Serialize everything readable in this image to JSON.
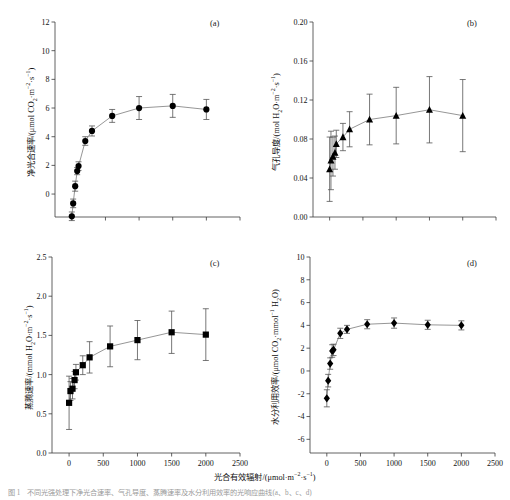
{
  "figure": {
    "xlabel": "光合有效辐射/(μmol·m⁻²·s⁻¹)",
    "caption": "图 1　不同光强处理下净光合速率、气孔导度、蒸腾速率及水分利用效率的光响应曲线(a、b、c、d)",
    "xticks": [
      "0",
      "500",
      "1000",
      "1500",
      "2000",
      "2500"
    ],
    "xlim": [
      -250,
      2500
    ]
  },
  "chart_data": [
    {
      "type": "line",
      "panel": "a",
      "tag": "(a)",
      "title": "",
      "marker": "circle",
      "xlabel": "光合有效辐射/(μmol·m⁻²·s⁻¹)",
      "ylabel": "净光合速率/(μmol CO₂·m⁻²·s⁻¹)",
      "ylabel_parts": {
        "name": "净光合速率",
        "unit_pre": "/(μmol CO",
        "unit_sub": "2",
        "unit_mid": "·m",
        "unit_sup1": "-2",
        "unit_mid2": "·s",
        "unit_sup2": "-1",
        "unit_post": ")"
      },
      "xlim": [
        -250,
        2500
      ],
      "ylim": [
        -1.6,
        12
      ],
      "yticks": [
        0,
        2,
        4,
        6,
        8,
        10,
        12
      ],
      "ytick_labels": [
        "0",
        "2",
        "4",
        "6",
        "8",
        "10",
        "12"
      ],
      "xticks_shown": false,
      "grid": false,
      "x": [
        0,
        20,
        50,
        80,
        100,
        200,
        300,
        600,
        1000,
        1500,
        2000
      ],
      "values": [
        -1.55,
        -0.65,
        0.55,
        1.6,
        1.95,
        3.7,
        4.4,
        5.45,
        6.0,
        6.15,
        5.9
      ],
      "yerr": [
        0.3,
        0.3,
        0.35,
        0.25,
        0.3,
        0.3,
        0.35,
        0.45,
        0.8,
        0.8,
        0.7
      ]
    },
    {
      "type": "line",
      "panel": "b",
      "tag": "(b)",
      "title": "",
      "marker": "triangle",
      "xlabel": "光合有效辐射/(μmol·m⁻²·s⁻¹)",
      "ylabel": "气孔导度/(mol H₂O·m⁻²·s⁻¹)",
      "ylabel_parts": {
        "name": "气孔导度",
        "unit_pre": "/(mol H",
        "unit_sub": "2",
        "unit_mid": "O·m",
        "unit_sup1": "-2",
        "unit_mid2": "·s",
        "unit_sup2": "-1",
        "unit_post": ")"
      },
      "xlim": [
        -250,
        2500
      ],
      "ylim": [
        0.0,
        0.2
      ],
      "yticks": [
        0.0,
        0.04,
        0.08,
        0.12,
        0.16,
        0.2
      ],
      "ytick_labels": [
        "0.00",
        "0.04",
        "0.08",
        "0.12",
        "0.16",
        "0.20"
      ],
      "xticks_shown": false,
      "grid": false,
      "x": [
        0,
        20,
        50,
        80,
        100,
        200,
        300,
        600,
        1000,
        1500,
        2000
      ],
      "values": [
        0.049,
        0.058,
        0.062,
        0.066,
        0.075,
        0.082,
        0.09,
        0.1,
        0.104,
        0.11,
        0.104
      ],
      "yerr": [
        0.033,
        0.03,
        0.02,
        0.017,
        0.014,
        0.014,
        0.018,
        0.026,
        0.029,
        0.034,
        0.037
      ]
    },
    {
      "type": "line",
      "panel": "c",
      "tag": "(c)",
      "title": "",
      "marker": "square",
      "xlabel": "光合有效辐射/(μmol·m⁻²·s⁻¹)",
      "ylabel": "蒸腾速率/(mmol H₂O·m⁻²·s⁻¹)",
      "ylabel_parts": {
        "name": "蒸腾速率",
        "unit_pre": "/(mmol H",
        "unit_sub": "2",
        "unit_mid": "O·m",
        "unit_sup1": "-2",
        "unit_mid2": "·s",
        "unit_sup2": "-1",
        "unit_post": ")"
      },
      "xlim": [
        -250,
        2500
      ],
      "ylim": [
        0.0,
        2.5
      ],
      "yticks": [
        0.0,
        0.5,
        1.0,
        1.5,
        2.0,
        2.5
      ],
      "ytick_labels": [
        "0.0",
        "0.5",
        "1.0",
        "1.5",
        "2.0",
        "2.5"
      ],
      "xticks_shown": true,
      "grid": false,
      "x": [
        0,
        20,
        50,
        80,
        100,
        200,
        300,
        600,
        1000,
        1500,
        2000
      ],
      "values": [
        0.64,
        0.79,
        0.82,
        0.93,
        1.03,
        1.12,
        1.22,
        1.36,
        1.44,
        1.54,
        1.51
      ],
      "yerr": [
        0.34,
        0.12,
        0.13,
        0.11,
        0.1,
        0.12,
        0.2,
        0.26,
        0.25,
        0.27,
        0.33
      ]
    },
    {
      "type": "line",
      "panel": "d",
      "tag": "(d)",
      "title": "",
      "marker": "diamond",
      "xlabel": "光合有效辐射/(μmol·m⁻²·s⁻¹)",
      "ylabel": "水分利用效率/(μmol CO₂·mmol⁻¹ H₂O)",
      "ylabel_parts": {
        "name": "水分利用效率",
        "unit_pre": "/(μmol CO",
        "unit_sub": "2",
        "unit_mid": "·mmol",
        "unit_sup1": "-1",
        "unit_mid2": " H",
        "unit_sup2": "2",
        "unit_post": "O)"
      },
      "xlim": [
        -250,
        2500
      ],
      "ylim": [
        -7.2,
        10
      ],
      "yticks": [
        -6,
        -4,
        -2,
        0,
        2,
        4,
        6,
        8,
        10
      ],
      "ytick_labels": [
        "-6",
        "-4",
        "-2",
        "0",
        "2",
        "4",
        "6",
        "8",
        "10"
      ],
      "xticks_shown": true,
      "grid": false,
      "x": [
        0,
        20,
        50,
        80,
        100,
        200,
        300,
        600,
        1000,
        1500,
        2000
      ],
      "values": [
        -2.4,
        -0.85,
        0.65,
        1.75,
        1.85,
        3.3,
        3.65,
        4.1,
        4.2,
        4.05,
        4.0
      ],
      "yerr": [
        0.75,
        0.55,
        0.5,
        0.55,
        0.5,
        0.45,
        0.35,
        0.4,
        0.45,
        0.4,
        0.4
      ]
    }
  ]
}
